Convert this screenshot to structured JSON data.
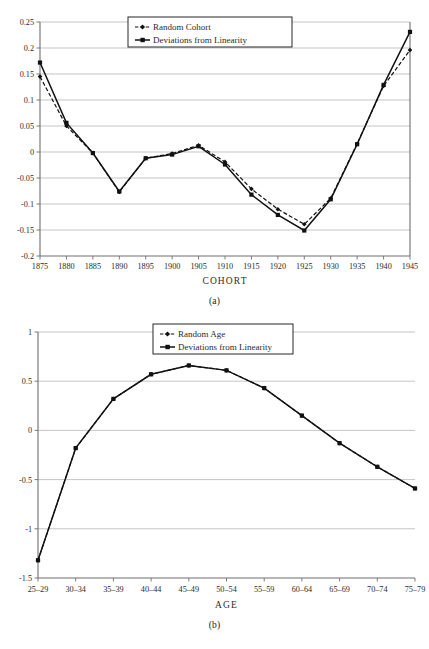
{
  "figure": {
    "caption_a": "(a)",
    "caption_b": "(b)"
  },
  "chart_data": [
    {
      "id": "chart-a",
      "type": "line",
      "title": "",
      "xlabel": "COHORT",
      "ylabel": "",
      "categories": [
        "1875",
        "1880",
        "1885",
        "1890",
        "1895",
        "1900",
        "1905",
        "1910",
        "1915",
        "1920",
        "1925",
        "1930",
        "1935",
        "1940",
        "1945"
      ],
      "ylim": [
        -0.2,
        0.25
      ],
      "yticks": [
        "0.25",
        "0.2",
        "0.15",
        "0.1",
        "0.05",
        "0",
        "-0.05",
        "-0.1",
        "-0.15",
        "-0.2"
      ],
      "ytick_values": [
        0.25,
        0.2,
        0.15,
        0.1,
        0.05,
        0,
        -0.05,
        -0.1,
        -0.15,
        -0.2
      ],
      "grid": true,
      "legend_position": "top-center",
      "series": [
        {
          "name": "Random Cohort",
          "style": "dashed",
          "marker": "diamond",
          "values": [
            0.145,
            0.05,
            -0.002,
            -0.077,
            -0.012,
            -0.003,
            0.013,
            -0.019,
            -0.071,
            -0.11,
            -0.139,
            -0.089,
            0.016,
            0.127,
            0.196
          ]
        },
        {
          "name": "Deviations from Linearity",
          "style": "solid",
          "marker": "square",
          "values": [
            0.172,
            0.056,
            -0.002,
            -0.076,
            -0.012,
            -0.005,
            0.011,
            -0.024,
            -0.082,
            -0.121,
            -0.151,
            -0.091,
            0.015,
            0.129,
            0.231
          ]
        }
      ]
    },
    {
      "id": "chart-b",
      "type": "line",
      "title": "",
      "xlabel": "AGE",
      "ylabel": "",
      "categories": [
        "25-29",
        "30-34",
        "35-39",
        "40-44",
        "45-49",
        "50-54",
        "55-59",
        "60-64",
        "65-69",
        "70-74",
        "75-79"
      ],
      "ylim": [
        -1.5,
        1
      ],
      "yticks": [
        "1",
        "0.5",
        "0",
        "-0.5",
        "-1",
        "-1.5"
      ],
      "ytick_values": [
        1,
        0.5,
        0,
        -0.5,
        -1,
        -1.5
      ],
      "grid": true,
      "legend_position": "top-center",
      "series": [
        {
          "name": "Random Age",
          "style": "dashed",
          "marker": "diamond",
          "values": [
            -1.32,
            -0.18,
            0.32,
            0.57,
            0.66,
            0.61,
            0.43,
            0.15,
            -0.13,
            -0.37,
            -0.59
          ]
        },
        {
          "name": "Deviations from Linearity",
          "style": "solid",
          "marker": "square",
          "values": [
            -1.32,
            -0.18,
            0.32,
            0.57,
            0.66,
            0.61,
            0.43,
            0.15,
            -0.13,
            -0.37,
            -0.59
          ]
        }
      ]
    }
  ]
}
